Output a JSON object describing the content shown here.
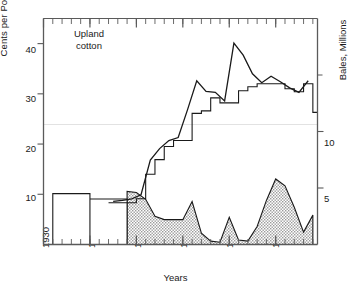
{
  "chart_data": {
    "type": "line",
    "title": "",
    "annotation": "Upland\ncotton",
    "xlabel": "Years",
    "ylabel_left": "Cents per Pound",
    "ylabel_right": "Bales, Millions",
    "xlim": [
      1930,
      1959.5
    ],
    "xticks": [
      1930,
      1935,
      1940,
      1945,
      1950,
      1955
    ],
    "xticks_minor_step": 1,
    "ylim_left": [
      0,
      45
    ],
    "yticks_left": [
      10,
      20,
      30,
      40
    ],
    "ylim_right": [
      0,
      20
    ],
    "yticks_right": [
      5,
      10
    ],
    "grid": "single faint horizontal line at 22.5 cents / 10 million bales",
    "legend": "none",
    "series": [
      {
        "name": "Market price (cents per pound)",
        "style": "solid thin line",
        "axis": "left",
        "x": [
          1937.5,
          1938.5,
          1939.5,
          1940.5,
          1941.5,
          1942.5,
          1943.5,
          1944.5,
          1945.5,
          1946.5,
          1947.5,
          1948.5,
          1949.5,
          1950.5,
          1951.5,
          1952.5,
          1953.5,
          1954.5,
          1955.5,
          1956.5,
          1957.5,
          1958.5
        ],
        "y": [
          8.6,
          8.8,
          9.1,
          9.9,
          16.8,
          19.1,
          20.7,
          21.3,
          26.8,
          32.6,
          30.5,
          30.3,
          28.6,
          40.1,
          37.7,
          34.0,
          32.2,
          33.5,
          32.4,
          31.2,
          30.3,
          32.6
        ]
      },
      {
        "name": "Support price (cents per pound)",
        "style": "solid step line",
        "axis": "left",
        "x": [
          1937,
          1938,
          1939,
          1940,
          1941,
          1942,
          1943,
          1944,
          1945,
          1946,
          1947,
          1948,
          1949,
          1950,
          1951,
          1952,
          1953,
          1954,
          1955,
          1956,
          1957,
          1958,
          1959
        ],
        "y": [
          8.3,
          8.3,
          8.3,
          9.1,
          14.0,
          16.9,
          19.5,
          20.7,
          20.7,
          26.1,
          26.6,
          29.2,
          28.2,
          28.2,
          30.6,
          31.4,
          32.0,
          32.0,
          32.0,
          31.0,
          30.4,
          32.0,
          26.3
        ]
      },
      {
        "name": "CCC stocks / carryover (million bales)",
        "style": "shaded hatched area",
        "axis": "right",
        "x": [
          1930,
          1931,
          1932,
          1933,
          1934,
          1935,
          1936,
          1937,
          1938,
          1939,
          1940,
          1941,
          1942,
          1943,
          1944,
          1945,
          1946,
          1947,
          1948,
          1949,
          1950,
          1951,
          1952,
          1953,
          1954,
          1955,
          1956,
          1957,
          1958,
          1959
        ],
        "y": [
          4.5,
          4.5,
          4.5,
          4.5,
          4.5,
          3.8,
          3.8,
          3.9,
          4.6,
          4.7,
          4.6,
          4.0,
          2.5,
          2.2,
          2.2,
          2.2,
          3.8,
          1.0,
          0.3,
          0.2,
          2.4,
          0.4,
          0.3,
          1.6,
          3.9,
          5.8,
          5.2,
          3.3,
          1.1,
          2.6
        ]
      }
    ],
    "bars_unfilled": {
      "name": "Early-period carryover bars (unshaded)",
      "x_range": [
        1931,
        1939
      ],
      "note": "white outlined bars for 1931-1939 carryover"
    }
  },
  "colors": {
    "axis": "#5a5a5a",
    "line": "#1a1a1a",
    "hatch_fill": "#c8c8c8",
    "grid": "#e2e2e2",
    "text": "#1a1a1a"
  },
  "icons": {
    "axis_ticks": "tick-mark-icon"
  }
}
